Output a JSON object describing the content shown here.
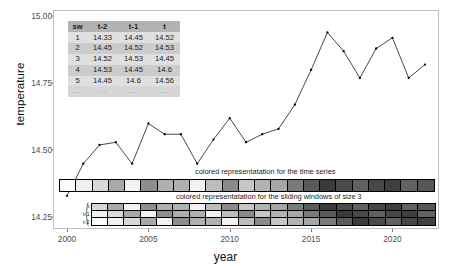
{
  "chart_data": {
    "type": "line",
    "title": "",
    "xlabel": "year",
    "ylabel": "temperature",
    "xlim": [
      1999.2,
      2022.8
    ],
    "ylim": [
      14.21,
      15.02
    ],
    "grid": false,
    "legend": "none",
    "x": [
      2000,
      2001,
      2002,
      2003,
      2004,
      2005,
      2006,
      2007,
      2008,
      2009,
      2010,
      2011,
      2012,
      2013,
      2014,
      2015,
      2016,
      2017,
      2018,
      2019,
      2020,
      2021,
      2022
    ],
    "values": [
      14.33,
      14.45,
      14.52,
      14.53,
      14.45,
      14.6,
      14.56,
      14.56,
      14.45,
      14.54,
      14.62,
      14.53,
      14.56,
      14.58,
      14.67,
      14.8,
      14.94,
      14.87,
      14.77,
      14.88,
      14.92,
      14.77,
      14.82
    ],
    "xticks": [
      "2000",
      "2005",
      "2010",
      "2015",
      "2020"
    ],
    "xtick_values": [
      2000,
      2005,
      2010,
      2015,
      2020
    ],
    "yticks": [
      "14.25",
      "14.50",
      "14.75",
      "15.00"
    ],
    "ytick_values": [
      14.25,
      14.5,
      14.75,
      15.0
    ],
    "marker": "point",
    "line_color": "#1a1a1a",
    "point_color": "#000000",
    "panel_background": "#ffffff",
    "panel_border": "#bfbfbf"
  },
  "inset_table": {
    "name": "sliding-window-table",
    "headers": [
      "sw",
      "t-2",
      "t-1",
      "t"
    ],
    "rows": [
      [
        "1",
        "14.33",
        "14.45",
        "14.52"
      ],
      [
        "2",
        "14.45",
        "14.52",
        "14.53"
      ],
      [
        "3",
        "14.52",
        "14.53",
        "14.45"
      ],
      [
        "4",
        "14.53",
        "14.45",
        "14.6"
      ],
      [
        "5",
        "14.45",
        "14.6",
        "14.56"
      ],
      [
        "...",
        "...",
        "...",
        "..."
      ]
    ],
    "header_background": "#b3b3b3",
    "row_background_odd": "#e0e0e0",
    "row_background_even": "#cccccc"
  },
  "annotations": {
    "series_strip_caption": "colored representatation for the time series",
    "windows_strip_caption": "colored representatation for the sliding windows of size 3"
  },
  "series_strip": {
    "name": "time-series-color-strip",
    "cell_count": 23,
    "shades": [
      "#fbfbfb",
      "#f0f0f0",
      "#d8d8d8",
      "#a8a8a8",
      "#f2f2f2",
      "#8e8e8e",
      "#b0b0b0",
      "#b0b0b0",
      "#f2f2f2",
      "#bdbdbd",
      "#8a8a8a",
      "#c6c6c6",
      "#b2b2b2",
      "#a6a6a6",
      "#7a7a7a",
      "#5a5a5a",
      "#3a3a3a",
      "#4a4a4a",
      "#616161",
      "#474747",
      "#3f3f3f",
      "#626262",
      "#565656"
    ]
  },
  "windows_strip": {
    "name": "sliding-windows-color-strip",
    "window_count": 21,
    "window_size": 3,
    "row_labels": [
      "t",
      "t-1",
      "t-2"
    ],
    "windows": [
      [
        "#d8d8d8",
        "#f0f0f0",
        "#fbfbfb"
      ],
      [
        "#a8a8a8",
        "#d8d8d8",
        "#f0f0f0"
      ],
      [
        "#f2f2f2",
        "#a8a8a8",
        "#d8d8d8"
      ],
      [
        "#8e8e8e",
        "#f2f2f2",
        "#a8a8a8"
      ],
      [
        "#b0b0b0",
        "#8e8e8e",
        "#f2f2f2"
      ],
      [
        "#b0b0b0",
        "#b0b0b0",
        "#8e8e8e"
      ],
      [
        "#f2f2f2",
        "#b0b0b0",
        "#b0b0b0"
      ],
      [
        "#bdbdbd",
        "#f2f2f2",
        "#b0b0b0"
      ],
      [
        "#8a8a8a",
        "#bdbdbd",
        "#f2f2f2"
      ],
      [
        "#c6c6c6",
        "#8a8a8a",
        "#bdbdbd"
      ],
      [
        "#b2b2b2",
        "#c6c6c6",
        "#8a8a8a"
      ],
      [
        "#a6a6a6",
        "#b2b2b2",
        "#c6c6c6"
      ],
      [
        "#7a7a7a",
        "#a6a6a6",
        "#b2b2b2"
      ],
      [
        "#5a5a5a",
        "#7a7a7a",
        "#a6a6a6"
      ],
      [
        "#3a3a3a",
        "#5a5a5a",
        "#7a7a7a"
      ],
      [
        "#4a4a4a",
        "#3a3a3a",
        "#5a5a5a"
      ],
      [
        "#616161",
        "#4a4a4a",
        "#3a3a3a"
      ],
      [
        "#474747",
        "#616161",
        "#4a4a4a"
      ],
      [
        "#3f3f3f",
        "#474747",
        "#616161"
      ],
      [
        "#626262",
        "#3f3f3f",
        "#474747"
      ],
      [
        "#565656",
        "#626262",
        "#3f3f3f"
      ]
    ]
  }
}
